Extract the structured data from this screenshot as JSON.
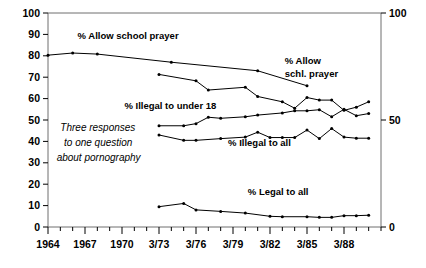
{
  "chart_data": {
    "type": "line",
    "title": "",
    "xlabel": "",
    "ylabel": "",
    "ylim": [
      0,
      100
    ],
    "xlim": [
      1964,
      1991
    ],
    "grid": false,
    "legend_position": "inline-annotations",
    "y_axis_left": {
      "min": 0,
      "max": 100,
      "ticks": [
        0,
        10,
        20,
        30,
        40,
        50,
        60,
        70,
        80,
        90,
        100
      ],
      "tick_labels": [
        "0",
        "10",
        "20",
        "30",
        "40",
        "50",
        "60",
        "70",
        "80",
        "90",
        "100"
      ]
    },
    "y_axis_right": {
      "min": 0,
      "max": 100,
      "ticks": [
        0,
        50,
        100
      ],
      "tick_labels": [
        "0",
        "50",
        "100"
      ]
    },
    "x_axis": {
      "labeled_ticks": [
        {
          "x": 1964,
          "label": "1964"
        },
        {
          "x": 1967,
          "label": "1967"
        },
        {
          "x": 1970,
          "label": "1970"
        },
        {
          "x": 1973,
          "label": "3/73"
        },
        {
          "x": 1976,
          "label": "3/76"
        },
        {
          "x": 1979,
          "label": "3/79"
        },
        {
          "x": 1982,
          "label": "3/82"
        },
        {
          "x": 1985,
          "label": "3/85"
        },
        {
          "x": 1988,
          "label": "3/88"
        }
      ],
      "minor_tick_step": 1
    },
    "annotations": [
      {
        "name": "allow-school-prayer-label",
        "text": "% Allow school prayer",
        "x": 1966.4,
        "y": 88
      },
      {
        "name": "allow-schl-prayer-label-line1",
        "text": "% Allow",
        "x": 1983.2,
        "y": 76
      },
      {
        "name": "allow-schl-prayer-label-line2",
        "text": "schl. prayer",
        "x": 1983.2,
        "y": 70
      },
      {
        "name": "illegal-under-18-label",
        "text": "% Illegal to under 18",
        "x": 1970.2,
        "y": 55
      },
      {
        "name": "illegal-to-all-label",
        "text": "% Illegal to all",
        "x": 1978.6,
        "y": 38
      },
      {
        "name": "legal-to-all-label",
        "text": "% Legal to all",
        "x": 1980.2,
        "y": 15
      },
      {
        "name": "note-line1",
        "text": "Three responses",
        "x": 1965.0,
        "y": 45
      },
      {
        "name": "note-line2",
        "text": "to one question",
        "x": 1965.3,
        "y": 38
      },
      {
        "name": "note-line3",
        "text": "about pornography",
        "x": 1964.7,
        "y": 31
      }
    ],
    "series": [
      {
        "name": "% Allow school prayer",
        "points": [
          {
            "x": 1964,
            "y": 80.3
          },
          {
            "x": 1966,
            "y": 81.3
          },
          {
            "x": 1968,
            "y": 80.8
          },
          {
            "x": 1974,
            "y": 77.0
          },
          {
            "x": 1981,
            "y": 73.0
          },
          {
            "x": 1985,
            "y": 66.0
          }
        ]
      },
      {
        "name": "% Allow schl. prayer",
        "points": [
          {
            "x": 1973,
            "y": 71.3
          },
          {
            "x": 1976,
            "y": 68.3
          },
          {
            "x": 1977,
            "y": 64.0
          },
          {
            "x": 1980,
            "y": 65.3
          },
          {
            "x": 1981,
            "y": 61.0
          },
          {
            "x": 1983,
            "y": 58.5
          },
          {
            "x": 1984,
            "y": 55.5
          },
          {
            "x": 1985,
            "y": 60.5
          },
          {
            "x": 1986,
            "y": 59.3
          },
          {
            "x": 1987,
            "y": 59.3
          },
          {
            "x": 1988,
            "y": 54.5
          },
          {
            "x": 1989,
            "y": 56.0
          },
          {
            "x": 1990,
            "y": 58.5
          }
        ]
      },
      {
        "name": "% Illegal to under 18",
        "points": [
          {
            "x": 1973,
            "y": 47.3
          },
          {
            "x": 1975,
            "y": 47.3
          },
          {
            "x": 1976,
            "y": 48.3
          },
          {
            "x": 1977,
            "y": 51.3
          },
          {
            "x": 1978,
            "y": 50.8
          },
          {
            "x": 1980,
            "y": 51.5
          },
          {
            "x": 1981,
            "y": 52.3
          },
          {
            "x": 1983,
            "y": 53.3
          },
          {
            "x": 1984,
            "y": 54.3
          },
          {
            "x": 1985,
            "y": 54.3
          },
          {
            "x": 1986,
            "y": 54.8
          },
          {
            "x": 1987,
            "y": 51.5
          },
          {
            "x": 1988,
            "y": 55.0
          },
          {
            "x": 1989,
            "y": 52.0
          },
          {
            "x": 1990,
            "y": 53.0
          }
        ]
      },
      {
        "name": "% Illegal to all",
        "points": [
          {
            "x": 1973,
            "y": 43.0
          },
          {
            "x": 1975,
            "y": 40.5
          },
          {
            "x": 1976,
            "y": 40.5
          },
          {
            "x": 1978,
            "y": 41.3
          },
          {
            "x": 1980,
            "y": 42.0
          },
          {
            "x": 1981,
            "y": 44.3
          },
          {
            "x": 1982,
            "y": 41.8
          },
          {
            "x": 1983,
            "y": 41.8
          },
          {
            "x": 1984,
            "y": 41.8
          },
          {
            "x": 1985,
            "y": 45.3
          },
          {
            "x": 1986,
            "y": 41.3
          },
          {
            "x": 1987,
            "y": 46.0
          },
          {
            "x": 1988,
            "y": 42.0
          },
          {
            "x": 1989,
            "y": 41.5
          },
          {
            "x": 1990,
            "y": 41.5
          }
        ]
      },
      {
        "name": "% Legal to all",
        "points": [
          {
            "x": 1973,
            "y": 9.5
          },
          {
            "x": 1975,
            "y": 11.0
          },
          {
            "x": 1976,
            "y": 8.0
          },
          {
            "x": 1978,
            "y": 7.3
          },
          {
            "x": 1980,
            "y": 6.5
          },
          {
            "x": 1982,
            "y": 5.0
          },
          {
            "x": 1983,
            "y": 4.8
          },
          {
            "x": 1985,
            "y": 4.8
          },
          {
            "x": 1986,
            "y": 4.5
          },
          {
            "x": 1987,
            "y": 4.5
          },
          {
            "x": 1988,
            "y": 5.3
          },
          {
            "x": 1989,
            "y": 5.3
          },
          {
            "x": 1990,
            "y": 5.5
          }
        ]
      }
    ]
  },
  "colors": {
    "line": "#000000",
    "frame": "#6f6f6f",
    "background": "#ffffff",
    "text": "#000000"
  }
}
